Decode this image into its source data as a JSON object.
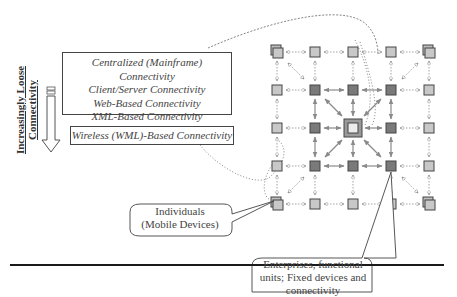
{
  "axis_label": {
    "line1": "Increasingly Loose",
    "line2": "Connectivity"
  },
  "connectivity_levels": [
    "Centralized (Mainframe) Connectivity",
    "Client/Server Connectivity",
    "Web-Based Connectivity",
    "XML-Based Connectivity"
  ],
  "wireless_level": "Wireless (WML)-Based Connectivity",
  "callouts": {
    "individuals": {
      "line1": "Individuals",
      "line2": "(Mobile Devices)"
    },
    "enterprises": {
      "line1": "Enterprises, functional",
      "line2": "units; Fixed devices and",
      "line3": "connectivity"
    }
  },
  "grid": {
    "columns": 5,
    "rows": 5,
    "node_types": {
      "mobile_stack": "light gray stacked square (mobile device)",
      "light": "light gray square",
      "dark": "dark gray square (enterprise)",
      "hub": "double-bordered central hub"
    },
    "colors": {
      "light_fill": "#c8c8c8",
      "dark_fill": "#7a7a7a",
      "hub_outer": "#9a9a9a",
      "hub_inner": "#e6e6e6",
      "border": "#444444",
      "dotted_arrow": "#9a9a9a",
      "solid_arrow": "#8a8a8a"
    }
  }
}
